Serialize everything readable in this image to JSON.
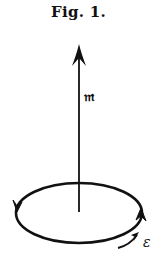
{
  "figure": {
    "title": "Fig. 1.",
    "vector_label": "𝔪",
    "current_label": "ε",
    "colors": {
      "ink": "#111111",
      "background": "#ffffff"
    },
    "elements": {
      "vector": {
        "name": "magnetic-moment-arrow",
        "direction": "up"
      },
      "loop": {
        "name": "current-loop",
        "shape": "ellipse",
        "circulation": "counterclockwise (viewed from above)"
      },
      "emf_arrow": {
        "name": "emf-direction-arrow"
      }
    }
  }
}
